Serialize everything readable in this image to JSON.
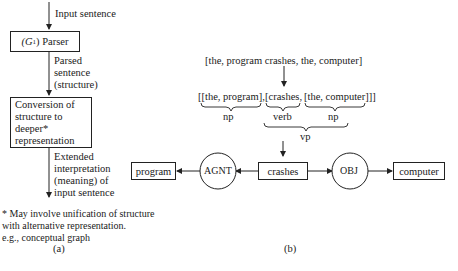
{
  "panel_a": {
    "input_label": "Input sentence",
    "parser_box": {
      "symbol": "(G",
      "subscript": "1",
      "label": ") Parser"
    },
    "parsed_label": "Parsed\nsentence\n(structure)",
    "conversion_box": "Conversion of\nstructure to\ndeeper*\nrepresentation",
    "output_label": "Extended\ninterpretation\n(meaning) of\ninput sentence",
    "footnote": "* May involve unification of structure\n   with alternative representation.\n   e.g., conceptual graph",
    "caption": "(a)"
  },
  "panel_b": {
    "input_list": "[the, program crashes, the, computer]",
    "parsed_list": {
      "part1": "[[the, program],",
      "part2": "[crashes,",
      "part3": "[the, computer]]]"
    },
    "brace_labels": {
      "np1": "np",
      "verb": "verb",
      "np2": "np",
      "vp": "vp"
    },
    "graph": {
      "nodes": {
        "program": "program",
        "agnt": "AGNT",
        "crashes": "crashes",
        "obj": "OBJ",
        "computer": "computer"
      }
    },
    "caption": "(b)"
  }
}
